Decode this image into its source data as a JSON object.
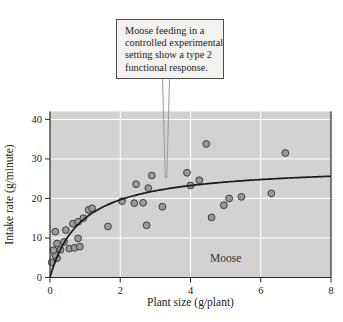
{
  "callout": {
    "text": "Moose feeding in a controlled experimental setting show a type 2 functional response.",
    "lines": [
      "Moose feeding in a",
      "controlled experimental",
      "setting show a type 2",
      "functional response."
    ]
  },
  "chart_data": {
    "type": "scatter",
    "title": "",
    "xlabel": "Plant size (g/plant)",
    "ylabel": "Intake rate (g/minute)",
    "xlim": [
      0,
      8
    ],
    "ylim": [
      0,
      42
    ],
    "xticks": [
      0,
      2,
      4,
      6,
      8
    ],
    "yticks": [
      0,
      10,
      20,
      30,
      40
    ],
    "grid": true,
    "legend": "none",
    "annotation": {
      "label": "Moose",
      "x": 5.0,
      "y": 5.0
    },
    "points": [
      [
        0.05,
        3.8
      ],
      [
        0.2,
        4.9
      ],
      [
        0.15,
        5.7
      ],
      [
        0.1,
        6.9
      ],
      [
        0.3,
        7.0
      ],
      [
        0.55,
        7.3
      ],
      [
        0.7,
        7.5
      ],
      [
        0.85,
        7.8
      ],
      [
        0.2,
        8.6
      ],
      [
        0.4,
        9.0
      ],
      [
        0.8,
        9.9
      ],
      [
        0.15,
        11.6
      ],
      [
        0.45,
        12.0
      ],
      [
        0.65,
        13.6
      ],
      [
        0.8,
        14.1
      ],
      [
        0.95,
        15.0
      ],
      [
        1.1,
        17.1
      ],
      [
        1.2,
        17.5
      ],
      [
        1.65,
        12.9
      ],
      [
        2.05,
        19.3
      ],
      [
        2.4,
        18.8
      ],
      [
        2.65,
        18.9
      ],
      [
        2.45,
        23.6
      ],
      [
        2.8,
        22.6
      ],
      [
        2.9,
        25.8
      ],
      [
        3.2,
        17.9
      ],
      [
        2.75,
        13.2
      ],
      [
        3.9,
        26.5
      ],
      [
        4.0,
        23.3
      ],
      [
        4.25,
        24.6
      ],
      [
        4.45,
        33.8
      ],
      [
        4.6,
        15.2
      ],
      [
        4.95,
        18.3
      ],
      [
        5.1,
        20.0
      ],
      [
        5.45,
        20.4
      ],
      [
        6.3,
        21.3
      ],
      [
        6.7,
        31.5
      ]
    ],
    "curve": {
      "description": "type 2 functional response",
      "formula": "y = a*x / (b + x)",
      "a": 28.5,
      "b": 0.9
    },
    "colors": {
      "plot_bg": "#d3d2d0",
      "grid": "#ffffff",
      "axis": "#2a2a2a",
      "tick_label": "#222222",
      "point_fill": "#9a9a9a",
      "point_stroke": "#3c3c3c",
      "curve": "#1a1a1a",
      "leader": "#9a9a9a",
      "callout_bg": "#f4f2ee",
      "callout_border": "#4f4f4f"
    }
  }
}
